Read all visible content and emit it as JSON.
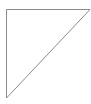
{
  "canvas": {
    "width": 91,
    "height": 104,
    "background": "#ffffff"
  },
  "shape": {
    "type": "right-triangle",
    "points": "6.5,9.5 90,9.5 6.5,98",
    "stroke": "#8a8a8a",
    "fill": "#ffffff",
    "stroke_width": 1
  }
}
